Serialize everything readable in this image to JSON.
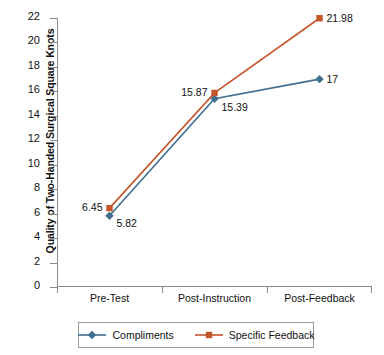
{
  "chart_data": {
    "type": "line",
    "title": "",
    "xlabel": "",
    "ylabel": "Quality of Two-Handed Surgical Square Knots",
    "categories": [
      "Pre-Test",
      "Post-Instruction",
      "Post-Feedback"
    ],
    "ylim": [
      0,
      22
    ],
    "ytick_step": 2,
    "yticks": [
      22,
      20,
      18,
      16,
      14,
      12,
      10,
      8,
      6,
      4,
      2,
      0
    ],
    "grid": false,
    "legend_position": "bottom",
    "series": [
      {
        "name": "Compliments",
        "color": "#3E6F8E",
        "marker": "diamond",
        "values": [
          5.82,
          15.39,
          17
        ],
        "labels": [
          "5.82",
          "15.39",
          "17"
        ],
        "label_side": [
          "right",
          "right",
          "right"
        ]
      },
      {
        "name": "Specific Feedback",
        "color": "#C4562B",
        "marker": "square",
        "values": [
          6.45,
          15.87,
          21.98
        ],
        "labels": [
          "6.45",
          "15.87",
          "21.98"
        ],
        "label_side": [
          "left",
          "left",
          "right"
        ]
      }
    ]
  },
  "legend": {
    "entries": [
      {
        "label": "Compliments"
      },
      {
        "label": "Specific Feedback"
      }
    ]
  }
}
